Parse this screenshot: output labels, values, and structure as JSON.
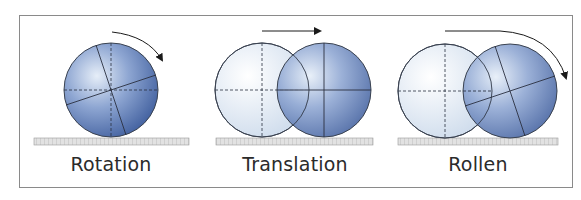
{
  "diagram": {
    "panels": [
      {
        "id": "rotation",
        "label": "Rotation",
        "motion": "curved arrow clockwise",
        "circles": 1
      },
      {
        "id": "translation",
        "label": "Translation",
        "motion": "straight arrow right",
        "circles": 2
      },
      {
        "id": "rollen",
        "label": "Rollen",
        "motion": "long curved arrow clockwise",
        "circles": 2
      }
    ],
    "colors": {
      "ball_dark": "#4a6aa8",
      "ball_light": "#dfe8f3",
      "ghost_fill": "#e8eef6",
      "outline": "#3a4250",
      "ground": "#c9c9c9",
      "frame": "#8a8a8a",
      "text": "#2b2b2b"
    }
  }
}
